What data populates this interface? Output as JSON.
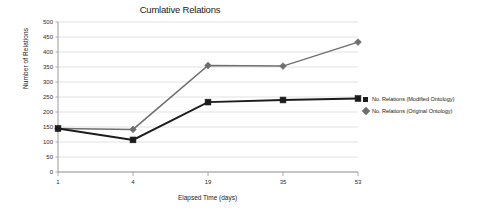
{
  "chart_data": {
    "type": "line",
    "title": "Cumlative Relations",
    "xlabel": "Elapsed Time (days)",
    "ylabel": "Number of Relations",
    "categories": [
      "1",
      "4",
      "19",
      "35",
      "53"
    ],
    "x": [
      1,
      4,
      19,
      35,
      53
    ],
    "series": [
      {
        "name": "No. Relations (Modified Ontology)",
        "values": [
          145,
          107,
          233,
          240,
          245
        ],
        "color": "#1c1c1c",
        "marker": "square"
      },
      {
        "name": "No. Relations (Original Ontology)",
        "values": [
          145,
          142,
          355,
          353,
          433
        ],
        "color": "#6e6e6e",
        "marker": "diamond"
      }
    ],
    "ylim": [
      0,
      500
    ],
    "y_ticks": [
      "0",
      "50",
      "100",
      "150",
      "200",
      "250",
      "300",
      "350",
      "400",
      "450",
      "500"
    ],
    "y_tick_values": [
      0,
      50,
      100,
      150,
      200,
      250,
      300,
      350,
      400,
      450,
      500
    ],
    "grid": true,
    "legend_position": "right"
  },
  "legend": {
    "entries": [
      {
        "label": "No. Relations (Modified Ontology)",
        "marker": "square"
      },
      {
        "label": "No. Relations (Original Ontology)",
        "marker": "diamond"
      }
    ]
  },
  "colors": {
    "modified": "#1c1c1c",
    "original": "#6e6e6e",
    "grid": "#d9d9d9",
    "axis": "#9a9a9a",
    "background": "#ffffff"
  }
}
